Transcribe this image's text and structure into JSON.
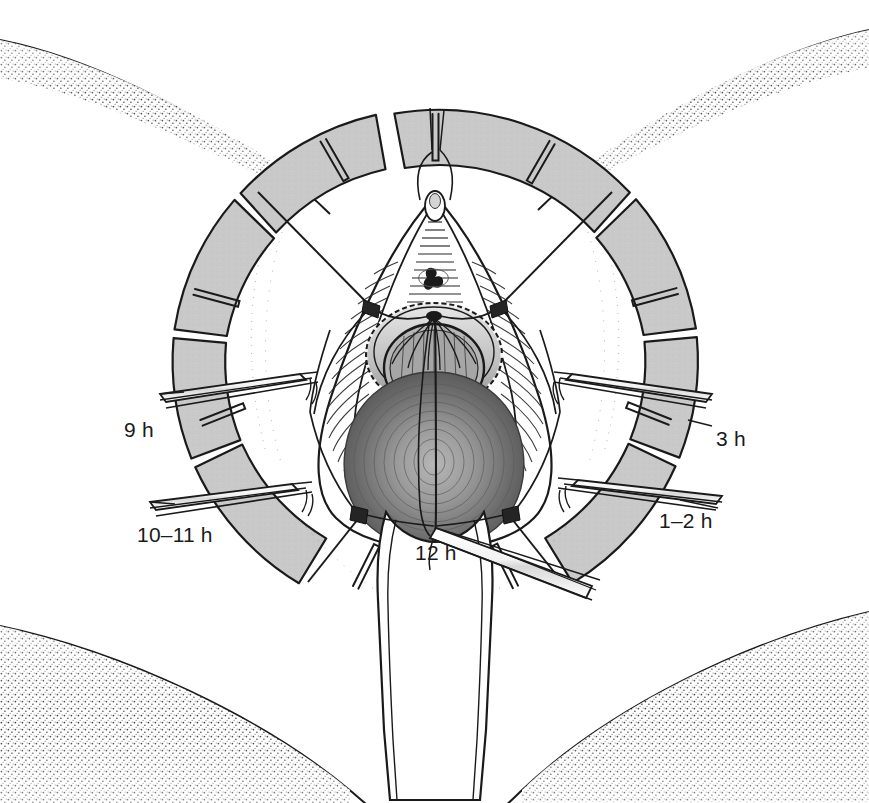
{
  "figure": {
    "background_color": "#ffffff",
    "ink_color": "#1a1a1a"
  },
  "ring": {
    "name": "circular-ring-retractor",
    "fill_color": "#c9c9c9",
    "stroke_color": "#1a1a1a",
    "center_x": 435,
    "center_y": 370,
    "outer_radius": 262,
    "inner_radius": 212,
    "segment_count": 8,
    "notch_count": 8
  },
  "labels": {
    "clock_positions": [
      {
        "id": "9h",
        "text": "9 h",
        "x": 124,
        "y": 419,
        "anchor_side": "left"
      },
      {
        "id": "3h",
        "text": "3 h",
        "x": 716,
        "y": 428,
        "anchor_side": "right"
      },
      {
        "id": "10-11h",
        "text": "10–11 h",
        "x": 137,
        "y": 524,
        "anchor_side": "left"
      },
      {
        "id": "1-2h",
        "text": "1–2 h",
        "x": 659,
        "y": 510,
        "anchor_side": "right"
      },
      {
        "id": "12h",
        "text": "12 h",
        "x": 415,
        "y": 542,
        "anchor_side": "center"
      }
    ]
  },
  "anatomy": {
    "upper_thigh_left": "stippled contour, upper left",
    "upper_thigh_right": "stippled contour, upper right",
    "lower_buttock_left": "stippled contour, lower left",
    "lower_buttock_right": "stippled contour, lower right",
    "central_mass_shading": "radial dark grey",
    "perineal_body": "white tongue-shaped flap, lower centre"
  },
  "instruments": {
    "retractor_blades": [
      {
        "id": "blade-9h",
        "side": "left",
        "clock": "9 h"
      },
      {
        "id": "blade-10-11h",
        "side": "left",
        "clock": "10–11 h"
      },
      {
        "id": "blade-3h",
        "side": "right",
        "clock": "3 h"
      },
      {
        "id": "blade-1-2h",
        "side": "right",
        "clock": "1–2 h"
      },
      {
        "id": "needle-holder-12h",
        "side": "bottom",
        "clock": "12 h"
      }
    ],
    "suture_anchor_count": 4,
    "suture_anchor_color": "#242424"
  }
}
